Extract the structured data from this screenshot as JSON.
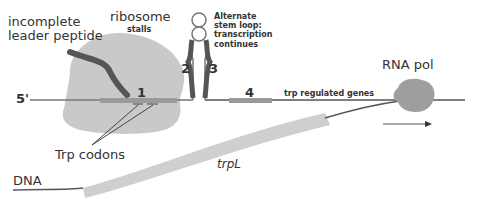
{
  "diagram": {
    "labels": {
      "incomplete_peptide": "incomplete\nleader peptide",
      "incomplete_line1": "incomplete",
      "incomplete_line2": "leader peptide",
      "ribosome": "ribosome",
      "stalls": "stalls",
      "alt_line1": "Alternate",
      "alt_line2": "stem loop:",
      "alt_line3": "transcription",
      "alt_line4": "continues",
      "region1": "1",
      "region2": "2",
      "region3": "3",
      "region4": "4",
      "five_prime": "5'",
      "trp_regulated": "trp regulated genes",
      "rna_pol": "RNA pol",
      "trp_codons": "Trp codons",
      "trpL": "trpL",
      "dna": "DNA"
    },
    "colors": {
      "ribosome": "#c9c9c9",
      "rna_dark": "#555555",
      "region_bar": "#9a9a9a",
      "dna_band": "#cfcfcf",
      "rna_pol": "#9e9e9e",
      "text": "#333333"
    }
  }
}
